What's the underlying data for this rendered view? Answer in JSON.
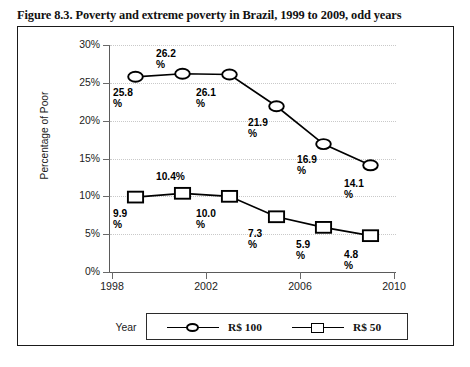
{
  "figure": {
    "caption": "Figure 8.3. Poverty and extreme poverty in Brazil, 1999 to 2009, odd years"
  },
  "axes": {
    "y_title": "Percentage of Poor",
    "x_title": "Year",
    "y_ticks": [
      "0%",
      "5%",
      "10%",
      "15%",
      "20%",
      "25%",
      "30%"
    ],
    "x_ticks": [
      "1998",
      "2002",
      "2006",
      "2010"
    ]
  },
  "legend": {
    "entries": [
      {
        "label": "R$ 100",
        "marker": "circle-marker-icon"
      },
      {
        "label": "R$ 50",
        "marker": "square-marker-icon"
      }
    ]
  },
  "labels": {
    "p100": [
      "25.8\n%",
      "26.2\n%",
      "26.1\n%",
      "21.9\n%",
      "16.9\n%",
      "14.1\n%"
    ],
    "p50": [
      "9.9\n%",
      "10.4%",
      "10.0\n%",
      "7.3\n%",
      "5.9\n%",
      "4.8\n%"
    ]
  },
  "chart_data": {
    "type": "line",
    "title": "Figure 8.3. Poverty and extreme poverty in Brazil, 1999 to 2009, odd years",
    "xlabel": "Year",
    "ylabel": "Percentage of Poor",
    "x": [
      1999,
      2001,
      2003,
      2005,
      2007,
      2009
    ],
    "xlim": [
      1998,
      2010
    ],
    "ylim": [
      0,
      30
    ],
    "y_tick_values": [
      0,
      5,
      10,
      15,
      20,
      25,
      30
    ],
    "y_tick_labels": [
      "0%",
      "5%",
      "10%",
      "15%",
      "20%",
      "25%",
      "30%"
    ],
    "x_tick_values": [
      1998,
      2002,
      2006,
      2010
    ],
    "x_tick_labels": [
      "1998",
      "2002",
      "2006",
      "2010"
    ],
    "grid": "horizontal-dotted",
    "legend_position": "bottom",
    "series": [
      {
        "name": "R$ 100",
        "marker": "circle",
        "values": [
          25.8,
          26.2,
          26.1,
          21.9,
          16.9,
          14.1
        ],
        "data_labels": [
          "25.8%",
          "26.2%",
          "26.1%",
          "21.9%",
          "16.9%",
          "14.1%"
        ]
      },
      {
        "name": "R$ 50",
        "marker": "square",
        "values": [
          9.9,
          10.4,
          10.0,
          7.3,
          5.9,
          4.8
        ],
        "data_labels": [
          "9.9%",
          "10.4%",
          "10.0%",
          "7.3%",
          "5.9%",
          "4.8%"
        ]
      }
    ]
  }
}
